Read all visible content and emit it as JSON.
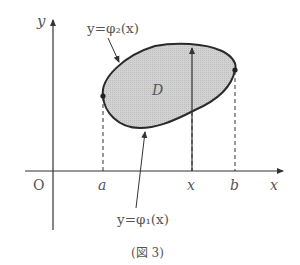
{
  "figure": {
    "caption": "(図 3)",
    "axes": {
      "x_label": "x",
      "y_label": "y",
      "origin_label": "O"
    },
    "ticks": {
      "a": "a",
      "x": "x",
      "b": "b"
    },
    "region_label": "D",
    "upper_curve_label": "y=φ₂(x)",
    "lower_curve_label": "y=φ₁(x)",
    "colors": {
      "region_fill": "#cfcfcf",
      "curve_stroke": "#2a2a2a",
      "axis_stroke": "#333333",
      "text": "#555555"
    }
  }
}
